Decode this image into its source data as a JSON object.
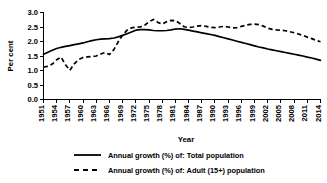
{
  "chart_data": {
    "type": "line",
    "title": "",
    "xlabel": "Year",
    "ylabel": "Per cent",
    "xlim": [
      1951,
      2014
    ],
    "ylim": [
      0.0,
      3.0
    ],
    "grid": false,
    "legend_position": "bottom",
    "ytick_labels": [
      "0.0",
      "0.5",
      "1.0",
      "1.5",
      "2.0",
      "2.5",
      "3.0"
    ],
    "ytick_values": [
      0.0,
      0.5,
      1.0,
      1.5,
      2.0,
      2.5,
      3.0
    ],
    "xtick_labels": [
      "1951",
      "1954",
      "1957",
      "1960",
      "1963",
      "1966",
      "1969",
      "1972",
      "1975",
      "1978",
      "1981",
      "1984",
      "1987",
      "1990",
      "1993",
      "1996",
      "1999",
      "2002",
      "2005",
      "2008",
      "2011",
      "2014"
    ],
    "x": [
      1951,
      1952,
      1953,
      1954,
      1955,
      1956,
      1957,
      1958,
      1959,
      1960,
      1961,
      1962,
      1963,
      1964,
      1965,
      1966,
      1967,
      1968,
      1969,
      1970,
      1971,
      1972,
      1973,
      1974,
      1975,
      1976,
      1977,
      1978,
      1979,
      1980,
      1981,
      1982,
      1983,
      1984,
      1985,
      1986,
      1987,
      1988,
      1989,
      1990,
      1991,
      1992,
      1993,
      1994,
      1995,
      1996,
      1997,
      1998,
      1999,
      2000,
      2001,
      2002,
      2003,
      2004,
      2005,
      2006,
      2007,
      2008,
      2009,
      2010,
      2011,
      2012,
      2013,
      2014
    ],
    "series": [
      {
        "name": "Annual growth (%) of: Total population",
        "style": "solid",
        "color": "#000000",
        "values": [
          1.56,
          1.63,
          1.7,
          1.76,
          1.8,
          1.83,
          1.86,
          1.89,
          1.92,
          1.95,
          1.99,
          2.03,
          2.06,
          2.08,
          2.09,
          2.1,
          2.12,
          2.16,
          2.21,
          2.27,
          2.33,
          2.39,
          2.41,
          2.41,
          2.4,
          2.38,
          2.37,
          2.37,
          2.38,
          2.4,
          2.43,
          2.44,
          2.42,
          2.39,
          2.36,
          2.33,
          2.3,
          2.27,
          2.24,
          2.21,
          2.17,
          2.13,
          2.09,
          2.05,
          2.01,
          1.97,
          1.93,
          1.89,
          1.85,
          1.81,
          1.78,
          1.74,
          1.71,
          1.68,
          1.65,
          1.62,
          1.59,
          1.56,
          1.53,
          1.5,
          1.46,
          1.43,
          1.39,
          1.35
        ]
      },
      {
        "name": "Annual growth (%) of: Adult (15+) population",
        "style": "dashed",
        "color": "#000000",
        "values": [
          1.12,
          1.14,
          1.22,
          1.37,
          1.46,
          1.2,
          1.01,
          1.23,
          1.38,
          1.45,
          1.47,
          1.48,
          1.5,
          1.57,
          1.62,
          1.55,
          1.72,
          1.99,
          2.22,
          2.39,
          2.47,
          2.49,
          2.5,
          2.56,
          2.68,
          2.76,
          2.66,
          2.6,
          2.68,
          2.73,
          2.72,
          2.62,
          2.51,
          2.48,
          2.5,
          2.53,
          2.55,
          2.52,
          2.49,
          2.48,
          2.5,
          2.52,
          2.5,
          2.47,
          2.48,
          2.52,
          2.56,
          2.59,
          2.6,
          2.58,
          2.53,
          2.46,
          2.42,
          2.4,
          2.39,
          2.37,
          2.34,
          2.3,
          2.26,
          2.21,
          2.15,
          2.1,
          2.04,
          1.99
        ]
      }
    ]
  },
  "legend": {
    "entries": [
      {
        "label": "Annual growth (%) of: Total population",
        "style": "solid"
      },
      {
        "label": "Annual growth (%) of: Adult (15+) population",
        "style": "dashed"
      }
    ]
  }
}
